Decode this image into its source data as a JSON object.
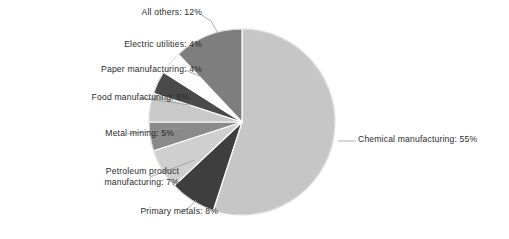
{
  "chart_data": {
    "type": "pie",
    "title": "",
    "subtitle": "",
    "xlabel": "",
    "ylabel": "",
    "legend_position": "none",
    "grid": false,
    "units": "percent",
    "start_angle_deg": 0,
    "direction": "clockwise",
    "categories": [
      "Chemical manufacturing",
      "Primary metals",
      "Petroleum product manufacturing",
      "Metal mining",
      "Food manufacturing",
      "Paper manufacturing",
      "Electric utilities",
      "All others"
    ],
    "values": [
      55,
      8,
      7,
      5,
      5,
      4,
      4,
      12
    ],
    "slices": [
      {
        "label": "Chemical manufacturing",
        "value": 55,
        "value_text": "55%",
        "color": "#c6c6c6"
      },
      {
        "label": "Primary metals",
        "value": 8,
        "value_text": "8%",
        "color": "#3e3e3e"
      },
      {
        "label": "Petroleum product manufacturing",
        "value": 7,
        "value_text": "7%",
        "color": "#cfcfcf"
      },
      {
        "label": "Metal mining",
        "value": 5,
        "value_text": "5%",
        "color": "#8a8a8a"
      },
      {
        "label": "Food manufacturing",
        "value": 5,
        "value_text": "5%",
        "color": "#c9c9c9"
      },
      {
        "label": "Paper manufacturing",
        "value": 4,
        "value_text": "4%",
        "color": "#4a4a4a"
      },
      {
        "label": "Electric utilities",
        "value": 4,
        "value_text": "4%",
        "color": "#fdfdfd"
      },
      {
        "label": "All others",
        "value": 12,
        "value_text": "12%",
        "color": "#7e7e7e"
      }
    ]
  },
  "callouts": {
    "all_others": "All others: 12%",
    "electric_utilities": "Electric utilities: 4%",
    "paper_manufacturing": "Paper manufacturing: 4%",
    "food_manufacturing": "Food manufacturing: 5%",
    "metal_mining": "Metal mining: 5%",
    "petroleum_product": "Petroleum product\nmanufacturing: 7%",
    "primary_metals": "Primary metals: 8%",
    "chemical_manufacturing": "Chemical manufacturing: 55%"
  },
  "style": {
    "background": "#ffffff",
    "text_color": "#2b2b2b",
    "leader_line_color": "#9a9a9a",
    "slice_edge_color": "#ffffff"
  }
}
